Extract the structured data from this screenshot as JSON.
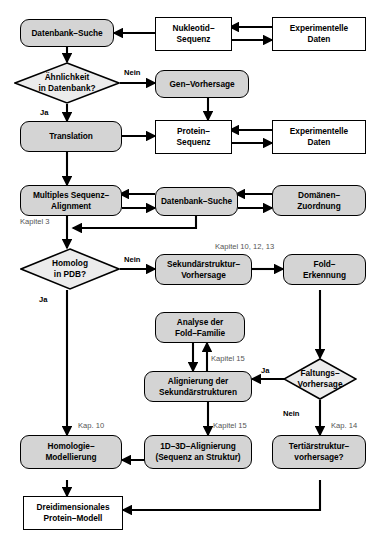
{
  "diagram": {
    "colors": {
      "process_fill": "#d4d4d4",
      "data_fill": "#ffffff",
      "decision_fill": "#ececec",
      "line": "#000000",
      "chapter_text": "#555555"
    },
    "nodes": {
      "datenbank_suche_1": "Datenbank–Suche",
      "nukleotid_sequenz": "Nukleotid–\nSequenz",
      "experimentelle_daten_1": "Experimentelle\nDaten",
      "aehnlichkeit": "Ähnlichkeit\nin Datenbank?",
      "gen_vorhersage": "Gen–Vorhersage",
      "translation": "Translation",
      "protein_sequenz": "Protein–\nSequenz",
      "experimentelle_daten_2": "Experimentelle\nDaten",
      "multiples_alignment": "Multiples Sequenz–\nAlignment",
      "datenbank_suche_2": "Datenbank–Suche",
      "domaenen_zuordnung": "Domänen–\nZuordnung",
      "homolog_pdb": "Homolog\nin PDB?",
      "sekundaerstruktur": "Sekundärstruktur–\nVorhersage",
      "fold_erkennung": "Fold–\nErkennung",
      "analyse_fold_familie": "Analyse der\nFold–Familie",
      "alignierung_sekundaer": "Alignierung der\nSekundärstrukturen",
      "faltungs_vorhersage": "Faltungs–\nVorhersage",
      "homologie_modellierung": "Homologie–\nModellierung",
      "alignierung_1d3d": "1D–3D–Alignierung\n(Sequenz an Struktur)",
      "tertiaerstruktur": "Tertiärstruktur–\nvorhersage?",
      "dreidimensionales_modell": "Dreidimensionales\nProtein–Modell"
    },
    "edge_labels": {
      "nein_1": "Nein",
      "ja_1": "Ja",
      "nein_2": "Nein",
      "ja_2": "Ja",
      "ja_3": "Ja",
      "nein_3": "Nein"
    },
    "chapter_labels": {
      "kapitel_3": "Kapitel 3",
      "kapitel_10_12_13": "Kapitel 10, 12, 13",
      "kapitel_15_a": "Kapitel 15",
      "kapitel_15_b": "Kapitel 15",
      "kap_10": "Kap. 10",
      "kap_14": "Kap. 14"
    }
  }
}
